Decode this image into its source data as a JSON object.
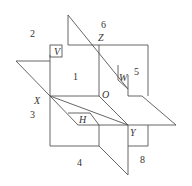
{
  "diagram": {
    "colors": {
      "line": "#555555",
      "text": "#333333",
      "background": "#ffffff"
    },
    "points": {
      "Z": "Z",
      "X": "X",
      "Y": "Y",
      "O": "O"
    },
    "plane_labels": {
      "V": "V",
      "W": "W",
      "H": "H"
    },
    "octants": [
      "1",
      "2",
      "3",
      "4",
      "5",
      "6",
      "8"
    ]
  }
}
